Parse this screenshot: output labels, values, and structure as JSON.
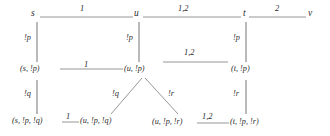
{
  "diagram": {
    "colors": {
      "line": "#8a8a8a",
      "text": "#2b2b2b",
      "background": "#ffffff"
    },
    "nodes": {
      "s": "s",
      "u": "u",
      "t": "t",
      "v": "v",
      "s_p": "(s, !p)",
      "u_p": "(u, !p)",
      "t_p": "(t, !p)",
      "s_p_q": "(s, !p, !q)",
      "u_p_q": "(u, !p, !q)",
      "u_p_r": "(u, !p, !r)",
      "t_p_r": "(t, !p, !r)"
    },
    "edge_labels": {
      "s_to_u": "1",
      "u_to_t": "1,2",
      "t_to_v": "2",
      "s_down": "!p",
      "u_down": "!p",
      "t_down": "!p",
      "sp_to_up": "1",
      "up_to_tp": "1,2",
      "sp_down": "!q",
      "up_left": "!q",
      "up_right": "!r",
      "tp_down": "!r",
      "spq_to_upq": "1",
      "upr_to_tpr": "1,2"
    }
  }
}
